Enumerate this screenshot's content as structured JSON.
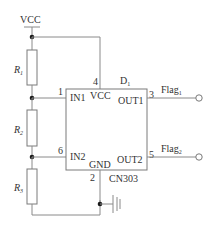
{
  "schematic": {
    "supply_label": "VCC",
    "resistors": [
      {
        "name": "R",
        "sub": "1"
      },
      {
        "name": "R",
        "sub": "2"
      },
      {
        "name": "R",
        "sub": "3"
      }
    ],
    "ic": {
      "designator": "D",
      "designator_sub": "1",
      "part_number": "CN303",
      "pins": {
        "in1": {
          "label": "IN1",
          "number": "1"
        },
        "vcc": {
          "label": "VCC",
          "number": "4"
        },
        "out1": {
          "label": "OUT1",
          "number": "3"
        },
        "in2": {
          "label": "IN2",
          "number": "6"
        },
        "gnd": {
          "label": "GND",
          "number": "2"
        },
        "out2": {
          "label": "OUT2",
          "number": "5"
        }
      }
    },
    "outputs": [
      {
        "name": "Flag",
        "sub": "1"
      },
      {
        "name": "Flag",
        "sub": "2"
      }
    ],
    "colors": {
      "wire": "#8a8a8a",
      "node": "#1a1a1a",
      "text": "#333333"
    }
  }
}
